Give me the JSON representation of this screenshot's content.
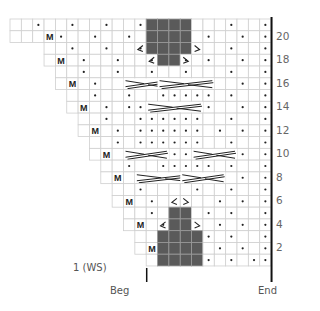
{
  "chart": {
    "grid": {
      "left": 10,
      "top": 19,
      "cell_w": 11.35,
      "cell_h": 11.76,
      "cols": 23,
      "rows": 21
    },
    "colors": {
      "grid": "#cfcfcf",
      "dark": "#5a5a5a",
      "ink": "#222222",
      "border": "#111111"
    },
    "row_labels": [
      "2",
      "4",
      "6",
      "8",
      "10",
      "12",
      "14",
      "16",
      "18",
      "20"
    ],
    "first_row_label": "1 (WS)",
    "beg_label": "Beg",
    "end_label": "End",
    "rows": [
      {
        "row": 21,
        "start": 0,
        "dots": [
          2,
          5,
          8,
          11,
          14,
          19,
          22
        ],
        "m": null,
        "dark": [
          12,
          13,
          14,
          15
        ]
      },
      {
        "row": 20,
        "start": 0,
        "dots": [
          4,
          7,
          10,
          13,
          17,
          20,
          22
        ],
        "m": 3,
        "dark": [
          12,
          13,
          14,
          15
        ]
      },
      {
        "row": 19,
        "start": 3,
        "dots": [
          5,
          8,
          11,
          14,
          19,
          22
        ],
        "m": null,
        "dark": [
          12,
          13,
          14,
          15
        ],
        "lean_l": [
          11
        ],
        "lean_r": [
          16
        ]
      },
      {
        "row": 18,
        "start": 3,
        "dots": [
          6,
          9,
          12,
          15,
          17,
          20,
          22
        ],
        "m": 4,
        "dark": [
          13,
          14
        ],
        "lean_l": [
          12
        ],
        "lean_r": [
          15
        ]
      },
      {
        "row": 17,
        "start": 4,
        "dots": [
          6,
          9,
          12,
          15,
          19,
          22
        ],
        "m": null
      },
      {
        "row": 16,
        "start": 4,
        "dots": [
          7,
          10,
          13,
          17,
          20,
          22
        ],
        "m": 5,
        "cables": [
          [
            10,
            13
          ],
          [
            13,
            17
          ]
        ]
      },
      {
        "row": 15,
        "start": 5,
        "dots": [
          7,
          10,
          13,
          14,
          15,
          16,
          17,
          19,
          22
        ],
        "m": null
      },
      {
        "row": 14,
        "start": 5,
        "dots": [
          8,
          10,
          11,
          12,
          17,
          20,
          22
        ],
        "m": 6,
        "cables": [
          [
            12,
            16
          ]
        ]
      },
      {
        "row": 13,
        "start": 6,
        "dots": [
          8,
          11,
          12,
          13,
          14,
          15,
          16,
          19,
          22
        ],
        "m": null
      },
      {
        "row": 12,
        "start": 6,
        "dots": [
          9,
          11,
          12,
          13,
          14,
          15,
          16,
          18,
          20,
          22
        ],
        "m": 7
      },
      {
        "row": 11,
        "start": 7,
        "dots": [
          9,
          11,
          12,
          13,
          14,
          15,
          16,
          19,
          22
        ],
        "m": null
      },
      {
        "row": 10,
        "start": 7,
        "dots": [
          10,
          12,
          13,
          14,
          15,
          20,
          22
        ],
        "m": 8,
        "cables": [
          [
            10,
            13
          ],
          [
            16,
            19
          ]
        ]
      },
      {
        "row": 9,
        "start": 8,
        "dots": [
          10,
          13,
          14,
          15,
          16,
          17,
          19,
          22
        ],
        "m": null
      },
      {
        "row": 8,
        "start": 8,
        "dots": [
          11,
          13,
          14,
          15,
          16,
          20,
          22
        ],
        "m": 9,
        "cables": [
          [
            11,
            15
          ],
          [
            15,
            18
          ]
        ]
      },
      {
        "row": 7,
        "start": 9,
        "dots": [
          11,
          16,
          19,
          22
        ],
        "m": null
      },
      {
        "row": 6,
        "start": 9,
        "dots": [
          12,
          18,
          20,
          22
        ],
        "m": 10,
        "lean_l": [
          14
        ],
        "lean_r": [
          15
        ]
      },
      {
        "row": 5,
        "start": 10,
        "dots": [
          12,
          17,
          19,
          22
        ],
        "m": null,
        "dark": [
          14,
          15
        ]
      },
      {
        "row": 4,
        "start": 10,
        "dots": [
          13,
          18,
          20,
          22
        ],
        "m": 11,
        "dark": [
          14,
          15
        ],
        "lean_l": [
          13
        ],
        "lean_r": [
          16
        ]
      },
      {
        "row": 3,
        "start": 11,
        "dots": [
          17,
          19,
          22
        ],
        "m": null,
        "dark": [
          13,
          14,
          15,
          16
        ]
      },
      {
        "row": 2,
        "start": 11,
        "dots": [
          18,
          20,
          22
        ],
        "m": 12,
        "dark": [
          13,
          14,
          15,
          16
        ]
      },
      {
        "row": 1,
        "start": 12,
        "dots": [
          17,
          19,
          21,
          22
        ],
        "m": null,
        "dark": [
          13,
          14,
          15,
          16
        ]
      }
    ]
  }
}
